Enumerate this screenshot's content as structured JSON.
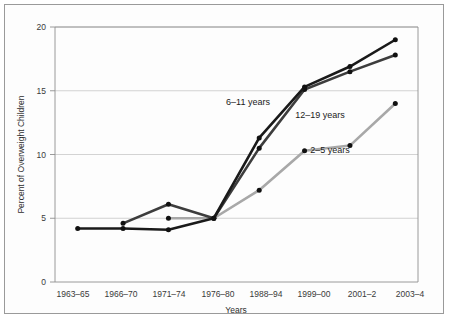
{
  "chart_data": {
    "type": "line",
    "title": "",
    "xlabel": "Years",
    "ylabel": "Percent of Overweight Children",
    "categories": [
      "1963–65",
      "1966–70",
      "1971–74",
      "1976–80",
      "1988–94",
      "1999–00",
      "2001–2",
      "2003–4"
    ],
    "ylim": [
      0,
      20
    ],
    "yticks": [
      0,
      5,
      10,
      15,
      20
    ],
    "ytick_labels": [
      "0",
      "5",
      "10",
      "15",
      "20"
    ],
    "grid": "horizontal",
    "legend_position": "inline-annotations",
    "series": [
      {
        "name": "6–11 years",
        "color": "#1a1a1a",
        "marker": "circle",
        "x": [
          "1963–65",
          "1966–70",
          "1971–74",
          "1976–80",
          "1988–94",
          "1999–00",
          "2001–2",
          "2003–4"
        ],
        "values": [
          4.2,
          4.2,
          4.1,
          5.0,
          11.3,
          15.3,
          16.9,
          19.0
        ]
      },
      {
        "name": "12–19 years",
        "color": "#3d3d3d",
        "marker": "circle",
        "x": [
          "1963–65",
          "1966–70",
          "1971–74",
          "1976–80",
          "1988–94",
          "1999–00",
          "2001–2",
          "2003–4"
        ],
        "values": [
          null,
          4.6,
          6.1,
          5.0,
          10.5,
          15.1,
          16.5,
          17.8
        ]
      },
      {
        "name": "2–5 years",
        "color": "#a8a8a8",
        "marker": "circle",
        "x": [
          "1963–65",
          "1966–70",
          "1971–74",
          "1976–80",
          "1988–94",
          "1999–00",
          "2001–2",
          "2003–4"
        ],
        "values": [
          null,
          null,
          5.0,
          5.0,
          7.2,
          10.3,
          10.7,
          14.0
        ]
      }
    ],
    "annotations": [
      {
        "text": "6–11 years",
        "x_px": 248,
        "y_px": 105,
        "series": "6–11 years"
      },
      {
        "text": "12–19 years",
        "x_px": 320,
        "y_px": 118,
        "series": "12–19 years"
      },
      {
        "text": "2–5 years",
        "x_px": 330,
        "y_px": 153,
        "series": "2–5 years"
      }
    ]
  },
  "colors": {
    "accent_dark": "#1a1a1a",
    "accent_mid": "#3d3d3d",
    "accent_light": "#a8a8a8",
    "grid": "#c8c8c8",
    "axis": "#8e8e8e",
    "frame": "#9a9a9a",
    "background": "#fdfdfd"
  }
}
